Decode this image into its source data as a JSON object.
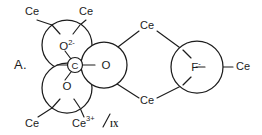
{
  "figure": {
    "panel_label": "A.",
    "caption": "",
    "colors": {
      "stroke": "#1c1c1c",
      "background": "#ffffff"
    },
    "atoms": [
      {
        "id": "oxide-top-left",
        "label": "O",
        "charge": "2-",
        "full_label": "O2-",
        "cx": 67,
        "cy": 45,
        "r": 25
      },
      {
        "id": "oxygen-right",
        "label": "O",
        "charge": "",
        "full_label": "O",
        "cx": 104,
        "cy": 65,
        "r": 23
      },
      {
        "id": "oxygen-bottom-left",
        "label": "O",
        "charge": "",
        "full_label": "O",
        "cx": 67,
        "cy": 88,
        "r": 25
      },
      {
        "id": "carbon-center",
        "label": "C",
        "charge": "",
        "full_label": "C",
        "cx": 75,
        "cy": 65,
        "r": 8
      },
      {
        "id": "fluoride",
        "label": "F",
        "charge": "-",
        "full_label": "F-",
        "cx": 197,
        "cy": 67,
        "r": 26
      }
    ],
    "ligands": [
      {
        "id": "ce-top-left",
        "text": "Ce",
        "x": 32,
        "y": 12,
        "anchor": "middle",
        "superscript": "",
        "fraction": ""
      },
      {
        "id": "ce-top-right",
        "text": "Ce",
        "x": 86,
        "y": 12,
        "anchor": "middle",
        "superscript": "",
        "fraction": ""
      },
      {
        "id": "ce-bottom-left",
        "text": "Ce",
        "x": 32,
        "y": 124,
        "anchor": "middle",
        "superscript": "",
        "fraction": ""
      },
      {
        "id": "ce-bottom-center",
        "text": "Ce",
        "x": 88,
        "y": 124,
        "anchor": "middle",
        "superscript": "3+",
        "fraction": "IX"
      },
      {
        "id": "ce-middle-upper",
        "text": "Ce",
        "x": 147,
        "y": 26,
        "anchor": "middle",
        "superscript": "",
        "fraction": ""
      },
      {
        "id": "ce-middle-lower",
        "text": "Ce",
        "x": 147,
        "y": 101,
        "anchor": "middle",
        "superscript": "",
        "fraction": ""
      },
      {
        "id": "ce-far-right",
        "text": "Ce",
        "x": 245,
        "y": 67,
        "anchor": "middle",
        "superscript": "",
        "fraction": ""
      }
    ],
    "bonds": [
      {
        "id": "bond-oxide-to-ce-top-left",
        "x1": 52,
        "y1": 25,
        "x2": 37,
        "y2": 20
      },
      {
        "id": "bond-oxide-to-ce-top-right",
        "x1": 80,
        "y1": 25,
        "x2": 86,
        "y2": 20
      },
      {
        "id": "bond-oxide-inner-top-left",
        "x1": 52,
        "y1": 25,
        "x2": 60,
        "y2": 33
      },
      {
        "id": "bond-oxide-inner-top-right",
        "x1": 80,
        "y1": 25,
        "x2": 73,
        "y2": 33
      },
      {
        "id": "bond-o-bl-to-ce-bottom-left",
        "x1": 52,
        "y1": 108,
        "x2": 38,
        "y2": 117
      },
      {
        "id": "bond-o-bl-to-ce-bottom-center",
        "x1": 80,
        "y1": 108,
        "x2": 84,
        "y2": 117
      },
      {
        "id": "bond-o-bl-inner-left",
        "x1": 52,
        "y1": 108,
        "x2": 60,
        "y2": 100
      },
      {
        "id": "bond-o-bl-inner-right",
        "x1": 80,
        "y1": 108,
        "x2": 74,
        "y2": 100
      },
      {
        "id": "bond-carbon-to-oxide",
        "x1": 71,
        "y1": 59,
        "x2": 65,
        "y2": 52
      },
      {
        "id": "bond-carbon-to-o-bl",
        "x1": 71,
        "y1": 72,
        "x2": 65,
        "y2": 80
      },
      {
        "id": "bond-carbon-to-o-right",
        "x1": 83,
        "y1": 65,
        "x2": 92,
        "y2": 65
      },
      {
        "id": "bond-carbon-stub-left",
        "x1": 67,
        "y1": 65,
        "x2": 58,
        "y2": 65
      },
      {
        "id": "bond-o-right-to-ce-mid-upper",
        "x1": 114,
        "y1": 50,
        "x2": 139,
        "y2": 31
      },
      {
        "id": "bond-o-right-to-ce-mid-lower",
        "x1": 114,
        "y1": 82,
        "x2": 139,
        "y2": 98
      },
      {
        "id": "bond-ce-mid-upper-to-f",
        "x1": 157,
        "y1": 31,
        "x2": 183,
        "y2": 50
      },
      {
        "id": "bond-ce-mid-lower-to-f",
        "x1": 157,
        "y1": 98,
        "x2": 183,
        "y2": 85
      },
      {
        "id": "bond-f-inner-upper",
        "x1": 183,
        "y1": 50,
        "x2": 190,
        "y2": 57
      },
      {
        "id": "bond-f-inner-lower",
        "x1": 183,
        "y1": 85,
        "x2": 190,
        "y2": 78
      },
      {
        "id": "bond-f-to-ce-far-right",
        "x1": 205,
        "y1": 67,
        "x2": 233,
        "y2": 67
      }
    ]
  }
}
